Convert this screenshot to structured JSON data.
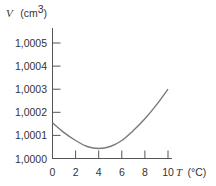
{
  "chart_data": {
    "type": "line",
    "title": "",
    "xlabel": "T",
    "xlabel_unit": "(°C)",
    "ylabel": "V",
    "ylabel_unit": "(cm",
    "ylabel_unit_sup": "3",
    "ylabel_unit_close": ")",
    "xlim": [
      0,
      10
    ],
    "ylim": [
      1.0,
      1.0005
    ],
    "x_ticks": [
      "0",
      "2",
      "4",
      "6",
      "8",
      "10"
    ],
    "y_ticks": [
      "1,0000",
      "1,0001",
      "1,0002",
      "1,0003",
      "1,0004",
      "1,0005"
    ],
    "grid": false,
    "legend": null,
    "series": [
      {
        "name": "V(T)",
        "color": "#7a7a7a",
        "x": [
          0,
          1,
          2,
          3,
          4,
          5,
          6,
          7,
          8,
          9,
          10
        ],
        "y": [
          1.000155,
          1.000112,
          1.000078,
          1.000052,
          1.000043,
          1.000052,
          1.000078,
          1.000121,
          1.000172,
          1.000232,
          1.0003
        ]
      }
    ]
  }
}
